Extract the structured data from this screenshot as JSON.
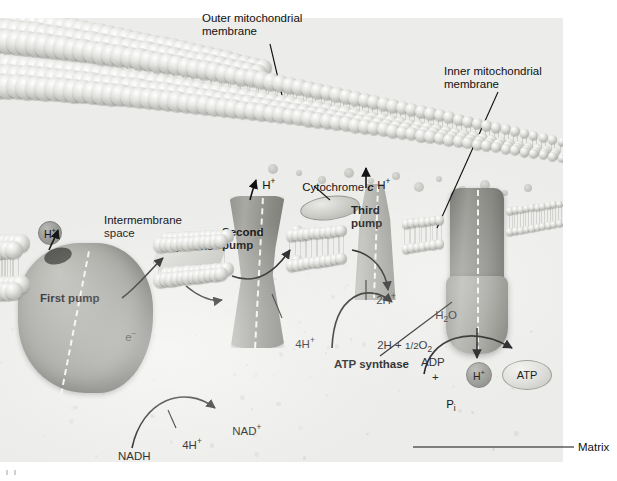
{
  "figure": {
    "kind": "mitochondrial electron transport chain diagram",
    "palette": {
      "background": "#ffffff",
      "panel": "#ececea",
      "membrane_head": "#b6b6b2",
      "protein": "#9d9d99",
      "ink": "#111111"
    }
  },
  "labels": {
    "outer_membrane": "Outer mitochondrial\nmembrane",
    "inner_membrane": "Inner mitochondrial\nmembrane",
    "intermembrane_space": "Intermembrane\nspace",
    "matrix": "Matrix",
    "first_pump": "First pump",
    "second_pump": "Second\npump",
    "third_pump": "Third\npump",
    "atp_synthase": "ATP synthase",
    "ubiquinone": "Ubiquinone",
    "cytochrome_c_pre": "Cytochrome ",
    "cytochrome_c_italic": "c"
  },
  "species": {
    "proton": "H",
    "proton_charge": "+",
    "electron_e": "e",
    "electron_charge": "−",
    "four_h_left": "4H",
    "four_h_second": "4H",
    "two_h_third": "2H",
    "nadh": "NADH",
    "nad_plus": "NAD",
    "nad_charge": "+",
    "water_h": "H",
    "water_sub": "2",
    "water_o": "O",
    "oxygen_eq_lead": "2H + ",
    "oxygen_eq_frac": "1/2",
    "oxygen_eq_o": "O",
    "oxygen_eq_sub": "2",
    "adp": "ADP",
    "plus": "+",
    "pi_p": "P",
    "pi_sub": "i",
    "atp": "ATP",
    "proton_circle_left": "H",
    "proton_circle_second": "H",
    "proton_circle_third": "H",
    "proton_circle_matrix": "H"
  }
}
